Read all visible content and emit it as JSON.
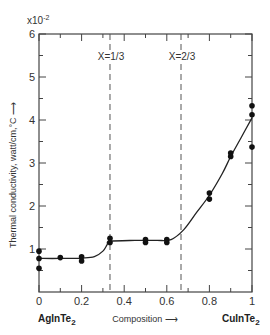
{
  "chart_data": {
    "type": "scatter",
    "title": "",
    "xlabel": "Composition",
    "ylabel": "Thermal conductivity, watt/cm,°C",
    "y_multiplier_label": "x10",
    "y_multiplier_exp": "-2",
    "xlim": [
      0,
      1
    ],
    "ylim": [
      0,
      6
    ],
    "x_ticks": [
      0,
      0.2,
      0.4,
      0.6,
      0.8,
      1
    ],
    "x_tick_labels": [
      "0",
      "0.2",
      "0.4",
      "0.6",
      "0.8",
      "1"
    ],
    "x_minor_ticks": [
      0.1,
      0.3,
      0.5,
      0.7,
      0.9
    ],
    "y_ticks": [
      1,
      2,
      3,
      4,
      5,
      6
    ],
    "y_tick_labels": [
      "1",
      "2",
      "3",
      "4",
      "5",
      "6"
    ],
    "y_minor_ticks": [
      0.5,
      1.5,
      2.5,
      3.5,
      4.5,
      5.5
    ],
    "grid": false,
    "left_compound": "AgInTe",
    "left_compound_sub": "2",
    "right_compound": "CuInTe",
    "right_compound_sub": "2",
    "annotations": [
      {
        "label": "X=1/3",
        "x": 0.3333
      },
      {
        "label": "X=2/3",
        "x": 0.6667
      }
    ],
    "points": [
      {
        "x": 0,
        "y": 0.95
      },
      {
        "x": 0,
        "y": 0.78
      },
      {
        "x": 0,
        "y": 0.55
      },
      {
        "x": 0.1,
        "y": 0.8
      },
      {
        "x": 0.2,
        "y": 0.82
      },
      {
        "x": 0.2,
        "y": 0.72
      },
      {
        "x": 0.3333,
        "y": 1.25
      },
      {
        "x": 0.3333,
        "y": 1.15
      },
      {
        "x": 0.5,
        "y": 1.22
      },
      {
        "x": 0.5,
        "y": 1.15
      },
      {
        "x": 0.6,
        "y": 1.22
      },
      {
        "x": 0.6,
        "y": 1.15
      },
      {
        "x": 0.8,
        "y": 2.3
      },
      {
        "x": 0.8,
        "y": 2.16
      },
      {
        "x": 0.9,
        "y": 3.23
      },
      {
        "x": 0.9,
        "y": 3.15
      },
      {
        "x": 1,
        "y": 4.33
      },
      {
        "x": 1,
        "y": 4.12
      },
      {
        "x": 1,
        "y": 3.37
      }
    ],
    "fit_curve": [
      {
        "x": 0,
        "y": 0.78
      },
      {
        "x": 0.1,
        "y": 0.78
      },
      {
        "x": 0.2,
        "y": 0.79
      },
      {
        "x": 0.26,
        "y": 0.82
      },
      {
        "x": 0.3,
        "y": 0.95
      },
      {
        "x": 0.32,
        "y": 1.1
      },
      {
        "x": 0.3333,
        "y": 1.18
      },
      {
        "x": 0.45,
        "y": 1.2
      },
      {
        "x": 0.55,
        "y": 1.2
      },
      {
        "x": 0.62,
        "y": 1.22
      },
      {
        "x": 0.68,
        "y": 1.45
      },
      {
        "x": 0.74,
        "y": 1.85
      },
      {
        "x": 0.8,
        "y": 2.25
      },
      {
        "x": 0.86,
        "y": 2.75
      },
      {
        "x": 0.9,
        "y": 3.15
      },
      {
        "x": 0.95,
        "y": 3.6
      },
      {
        "x": 1,
        "y": 4.05
      }
    ]
  }
}
